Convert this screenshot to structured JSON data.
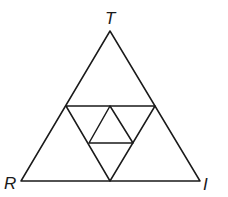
{
  "diagram": {
    "type": "nested-triangles",
    "labels": {
      "top": "T",
      "bottom_left": "R",
      "bottom_right": "I"
    },
    "vertices": {
      "T": [
        110,
        31
      ],
      "R": [
        21,
        181
      ],
      "I": [
        200,
        181
      ]
    },
    "colors": {
      "stroke": "#1a1a1a",
      "background": "#ffffff"
    }
  }
}
